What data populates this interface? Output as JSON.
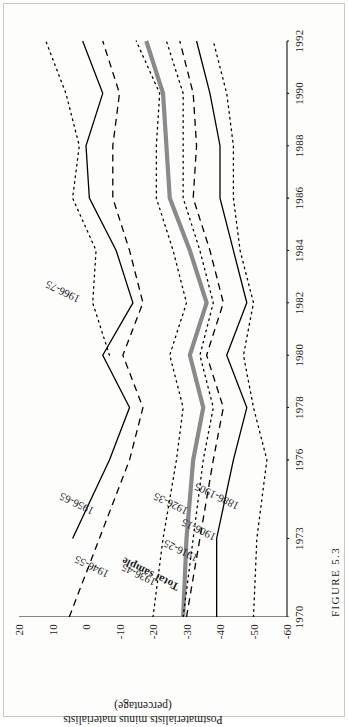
{
  "figure": {
    "caption": "FIGURE 5.3",
    "y_axis_title_line1": "Postmaterialists minus materialists",
    "y_axis_title_line2": "(percentage)"
  },
  "chart_data": {
    "type": "line",
    "title": "FIGURE 5.3",
    "xlabel": "",
    "ylabel": "Postmaterialists minus materialists (percentage)",
    "grid": false,
    "legend": "inline-labels",
    "xlim": [
      1970,
      1992
    ],
    "ylim": [
      -60,
      20
    ],
    "yticks": [
      20,
      10,
      0,
      -10,
      -20,
      -30,
      -40,
      -50,
      -60
    ],
    "ytick_labels": [
      "20",
      "10",
      "0",
      "-10",
      "-20",
      "-30",
      "-40",
      "-50",
      "-60"
    ],
    "xticks": [
      1970,
      1973,
      1976,
      1978,
      1980,
      1982,
      1984,
      1986,
      1988,
      1990,
      1992
    ],
    "xtick_labels": [
      "1970",
      "1973",
      "1976",
      "1978",
      "1980",
      "1982",
      "1984",
      "1986",
      "1988",
      "1990",
      "1992"
    ],
    "x": [
      1970,
      1973,
      1976,
      1978,
      1980,
      1982,
      1984,
      1986,
      1988,
      1990,
      1992
    ],
    "series": [
      {
        "name": "1966-75",
        "label": "1966-75",
        "style": "dotted",
        "color": "#000000",
        "width": 1.3,
        "values": [
          null,
          null,
          null,
          null,
          -7,
          -2,
          -3,
          4,
          2,
          6,
          12
        ],
        "label_x": 1982.1,
        "label_y": 2.0,
        "label_rot": -64
      },
      {
        "name": "1956-65",
        "label": "1956-65",
        "style": "solid",
        "color": "#000000",
        "width": 1.3,
        "values": [
          null,
          4,
          -7,
          -13,
          -5,
          -14,
          -9,
          -1,
          0,
          -5,
          1
        ],
        "label_x": 1974.0,
        "label_y": -2.0,
        "label_rot": -64
      },
      {
        "name": "1946-55",
        "label": "1946-55",
        "style": "dashed",
        "color": "#000000",
        "width": 1.3,
        "values": [
          5,
          -4,
          -13,
          -17,
          -11,
          -17,
          -13,
          -8,
          -8,
          -10,
          -5
        ],
        "label_x": 1971.6,
        "label_y": -6.5,
        "label_rot": -64
      },
      {
        "name": "1936-45",
        "label": "1936-45",
        "style": "dotted",
        "color": "#000000",
        "width": 1.3,
        "values": [
          -20,
          -23,
          -27,
          -29,
          -25,
          -30,
          -26,
          -21,
          -21,
          -22,
          -15
        ],
        "label_x": 1971.3,
        "label_y": -20.5,
        "label_rot": -64
      },
      {
        "name": "Total sample",
        "label": "Total sample",
        "style": "solid",
        "color": "#8a8a8a",
        "width": 4.2,
        "values": [
          -29,
          -30,
          -32,
          -35,
          -31,
          -36,
          -31,
          -25,
          -24,
          -23,
          -18
        ],
        "label_x": 1971.1,
        "label_y": -27.5,
        "label_rot": -64,
        "emphasis": true
      },
      {
        "name": "1926-35",
        "label": "1926-35",
        "style": "dotted",
        "color": "#000000",
        "width": 1.3,
        "values": [
          -29,
          -32,
          -35,
          -38,
          -34,
          -38,
          -34,
          -29,
          -29,
          -29,
          -24
        ],
        "label_x": 1974.0,
        "label_y": -30.0,
        "label_rot": -64
      },
      {
        "name": "1916-25",
        "label": "1916-25",
        "style": "dashed",
        "color": "#000000",
        "width": 1.3,
        "values": [
          -30,
          -34,
          -38,
          -41,
          -36,
          -41,
          -37,
          -32,
          -33,
          -32,
          -28
        ],
        "label_x": 1972.2,
        "label_y": -33.0,
        "label_rot": -64
      },
      {
        "name": "1906-15",
        "label": "1906-15",
        "style": "solid",
        "color": "#000000",
        "width": 1.3,
        "values": [
          -39,
          -39,
          -44,
          -48,
          -42,
          -48,
          -44,
          -40,
          -40,
          -37,
          -33
        ],
        "label_x": 1973.0,
        "label_y": -38.5,
        "label_rot": -64
      },
      {
        "name": "1886-1905",
        "label": "1886-1905",
        "style": "dotted",
        "color": "#000000",
        "width": 1.3,
        "values": [
          -50,
          -51,
          -54,
          -50,
          -47,
          -50,
          -46,
          -44,
          -44,
          -42,
          -38
        ],
        "label_x": 1974.2,
        "label_y": -45.5,
        "label_rot": -64
      }
    ]
  }
}
